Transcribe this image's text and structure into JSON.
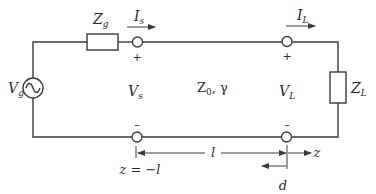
{
  "diagram": {
    "colors": {
      "line": "#3a3a3a",
      "text": "#2a2a2a",
      "background": "#ffffff"
    },
    "labels": {
      "source_voltage": {
        "main": "V",
        "sub": "g"
      },
      "source_impedance": {
        "main": "Z",
        "sub": "g"
      },
      "source_current": {
        "main": "I",
        "sub": "s"
      },
      "load_current": {
        "main": "I",
        "sub": "L"
      },
      "load_impedance": {
        "main": "Z",
        "sub": "L"
      },
      "sending_voltage": {
        "main": "V",
        "sub": "s"
      },
      "load_voltage": {
        "main": "V",
        "sub": "L"
      },
      "line_params": {
        "main": "Z",
        "sub": "0",
        "rest": ", γ"
      },
      "sending_plus": "+",
      "sending_minus": "–",
      "load_plus": "+",
      "load_minus": "–",
      "sending_position": "z = −l",
      "length": "l",
      "axis": "z",
      "distance": "d"
    },
    "icons": {
      "ac_source": "ac-voltage-source-icon",
      "resistor_g": "impedance-box-icon",
      "resistor_l": "impedance-box-icon",
      "terminal": "open-terminal-circle-icon"
    }
  }
}
